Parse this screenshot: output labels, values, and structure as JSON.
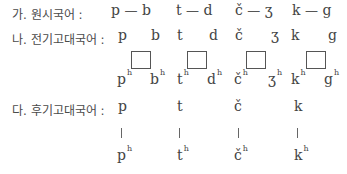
{
  "rows": {
    "proto": {
      "label": "가. 원시국어 :",
      "pairs": [
        {
          "left": "p",
          "dash": "—",
          "right": "b"
        },
        {
          "left": "t",
          "dash": "—",
          "right": "d"
        },
        {
          "left": "č",
          "dash": "—",
          "right": "ʒ"
        },
        {
          "left": "k",
          "dash": "—",
          "right": "g"
        }
      ]
    },
    "early_old": {
      "label": "나. 전기고대국어 :",
      "top": [
        "p",
        "b",
        "t",
        "d",
        "č",
        "ʒ",
        "k",
        "g"
      ],
      "bottom": [
        {
          "base": "p",
          "sup": "h"
        },
        {
          "base": "b",
          "sup": "h"
        },
        {
          "base": "t",
          "sup": "h"
        },
        {
          "base": "d",
          "sup": "h"
        },
        {
          "base": "č",
          "sup": "h"
        },
        {
          "base": "ʒ",
          "sup": "h"
        },
        {
          "base": "k",
          "sup": "h"
        },
        {
          "base": "g",
          "sup": "h"
        }
      ],
      "boxes": 4
    },
    "late_old": {
      "label": "다. 후기고대국어 :",
      "top": [
        "p",
        "t",
        "č",
        "k"
      ],
      "connector": "|",
      "bottom": [
        {
          "base": "p",
          "sup": "h"
        },
        {
          "base": "t",
          "sup": "h"
        },
        {
          "base": "č",
          "sup": "h"
        },
        {
          "base": "k",
          "sup": "h"
        }
      ]
    }
  }
}
